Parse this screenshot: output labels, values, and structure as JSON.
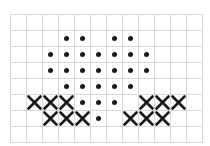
{
  "chart_data": {
    "type": "table",
    "xlabel": "",
    "ylabel": "",
    "grid": true,
    "columns": 12,
    "rows": 8,
    "cell_size_px": 16,
    "legend": [
      {
        "symbol": "dot",
        "name": "filled-dot-stitch",
        "color": "#1a1a1a"
      },
      {
        "symbol": "cross",
        "name": "cross-stitch",
        "color": "#1a1a1a"
      }
    ],
    "grid_color": "#d8d8d8",
    "background_color": "#ffffff",
    "cells": [
      {
        "row": 1,
        "col": 3,
        "symbol": "dot"
      },
      {
        "row": 1,
        "col": 4,
        "symbol": "dot"
      },
      {
        "row": 1,
        "col": 6,
        "symbol": "dot"
      },
      {
        "row": 1,
        "col": 7,
        "symbol": "dot"
      },
      {
        "row": 2,
        "col": 2,
        "symbol": "dot"
      },
      {
        "row": 2,
        "col": 3,
        "symbol": "dot"
      },
      {
        "row": 2,
        "col": 4,
        "symbol": "dot"
      },
      {
        "row": 2,
        "col": 5,
        "symbol": "dot"
      },
      {
        "row": 2,
        "col": 6,
        "symbol": "dot"
      },
      {
        "row": 2,
        "col": 7,
        "symbol": "dot"
      },
      {
        "row": 2,
        "col": 8,
        "symbol": "dot"
      },
      {
        "row": 3,
        "col": 2,
        "symbol": "dot"
      },
      {
        "row": 3,
        "col": 3,
        "symbol": "dot"
      },
      {
        "row": 3,
        "col": 4,
        "symbol": "dot"
      },
      {
        "row": 3,
        "col": 5,
        "symbol": "dot"
      },
      {
        "row": 3,
        "col": 6,
        "symbol": "dot"
      },
      {
        "row": 3,
        "col": 7,
        "symbol": "dot"
      },
      {
        "row": 3,
        "col": 8,
        "symbol": "dot"
      },
      {
        "row": 4,
        "col": 3,
        "symbol": "dot"
      },
      {
        "row": 4,
        "col": 4,
        "symbol": "dot"
      },
      {
        "row": 4,
        "col": 5,
        "symbol": "dot"
      },
      {
        "row": 4,
        "col": 6,
        "symbol": "dot"
      },
      {
        "row": 4,
        "col": 7,
        "symbol": "dot"
      },
      {
        "row": 5,
        "col": 1,
        "symbol": "cross"
      },
      {
        "row": 5,
        "col": 2,
        "symbol": "cross"
      },
      {
        "row": 5,
        "col": 3,
        "symbol": "cross"
      },
      {
        "row": 5,
        "col": 4,
        "symbol": "dot"
      },
      {
        "row": 5,
        "col": 5,
        "symbol": "dot"
      },
      {
        "row": 5,
        "col": 6,
        "symbol": "dot"
      },
      {
        "row": 5,
        "col": 8,
        "symbol": "cross"
      },
      {
        "row": 5,
        "col": 9,
        "symbol": "cross"
      },
      {
        "row": 5,
        "col": 10,
        "symbol": "cross"
      },
      {
        "row": 6,
        "col": 2,
        "symbol": "cross"
      },
      {
        "row": 6,
        "col": 3,
        "symbol": "cross"
      },
      {
        "row": 6,
        "col": 4,
        "symbol": "cross"
      },
      {
        "row": 6,
        "col": 5,
        "symbol": "dot"
      },
      {
        "row": 6,
        "col": 7,
        "symbol": "cross"
      },
      {
        "row": 6,
        "col": 8,
        "symbol": "cross"
      },
      {
        "row": 6,
        "col": 9,
        "symbol": "cross"
      }
    ]
  }
}
